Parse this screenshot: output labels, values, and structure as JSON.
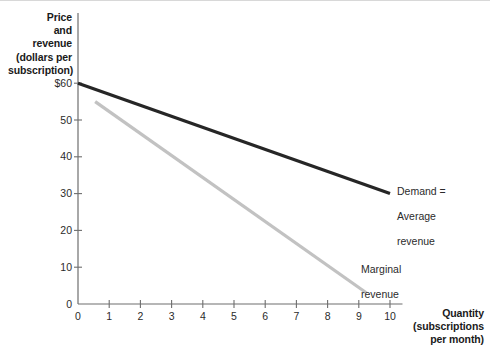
{
  "chart_data": {
    "type": "line",
    "title": "",
    "ylabel": "Price\nand\nrevenue\n(dollars per\nsubscription)",
    "ylabel_lines": [
      "Price",
      "and",
      "revenue",
      "(dollars per",
      "subscription)"
    ],
    "xlabel": "Quantity\n(subscriptions\nper month)",
    "xlabel_lines": [
      "Quantity",
      "(subscriptions",
      "per month)"
    ],
    "xlim": [
      0,
      10.4
    ],
    "ylim": [
      0,
      63
    ],
    "grid": false,
    "legend_position": "inline-annotations",
    "yticks": [
      "0",
      "10",
      "20",
      "30",
      "40",
      "50",
      "$60"
    ],
    "ytick_values": [
      0,
      10,
      20,
      30,
      40,
      50,
      60
    ],
    "xticks": [
      "0",
      "1",
      "2",
      "3",
      "4",
      "5",
      "6",
      "7",
      "8",
      "9",
      "10"
    ],
    "xtick_values": [
      0,
      1,
      2,
      3,
      4,
      5,
      6,
      7,
      8,
      9,
      10
    ],
    "series": [
      {
        "name": "Demand = Average revenue",
        "label_lines": [
          "Demand =",
          "Average",
          "revenue"
        ],
        "color": "#262626",
        "width": 3.2,
        "x": [
          0,
          10
        ],
        "y": [
          60,
          30
        ]
      },
      {
        "name": "Marginal revenue",
        "label_lines": [
          "Marginal",
          "revenue"
        ],
        "color": "#c2c2c2",
        "width": 3.2,
        "x": [
          0.55,
          9.25
        ],
        "y": [
          55,
          3
        ]
      }
    ],
    "axis_color": "#6e6e6e"
  }
}
